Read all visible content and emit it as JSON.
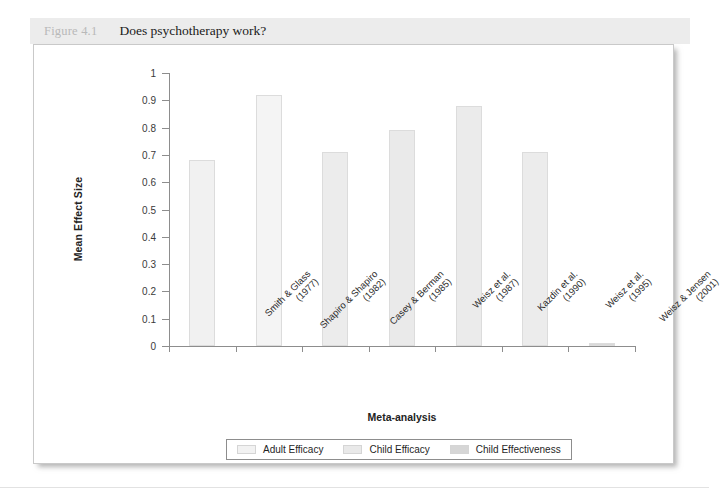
{
  "figure": {
    "number_label": "Figure 4.1",
    "title": "Does psychotherapy work?"
  },
  "chart_data": {
    "type": "bar",
    "title": "Does psychotherapy work?",
    "xlabel": "Meta-analysis",
    "ylabel": "Mean Effect Size",
    "ylim": [
      0,
      1
    ],
    "ytick_step": 0.1,
    "grid": false,
    "legend_position": "bottom",
    "categories": [
      "Smith & Glass (1977)",
      "Shapiro & Shapiro (1982)",
      "Casey & Berman (1985)",
      "Weisz et al. (1987)",
      "Kazdin et al. (1990)",
      "Weisz et al. (1995)",
      "Weisz & Jensen (2001)"
    ],
    "category_lines": [
      [
        "Smith & Glass",
        "(1977)"
      ],
      [
        "Shapiro & Shapiro",
        "(1982)"
      ],
      [
        "Casey & Berman",
        "(1985)"
      ],
      [
        "Weisz et al.",
        "(1987)"
      ],
      [
        "Kazdin et al.",
        "(1990)"
      ],
      [
        "Weisz et al.",
        "(1995)"
      ],
      [
        "Weisz & Jensen",
        "(2001)"
      ]
    ],
    "values": [
      0.68,
      0.92,
      0.71,
      0.79,
      0.88,
      0.71,
      0.01
    ],
    "bar_series": [
      "Adult Efficacy",
      "Adult Efficacy",
      "Child Efficacy",
      "Child Efficacy",
      "Child Efficacy",
      "Child Efficacy",
      "Child Effectiveness"
    ],
    "bar_colors": [
      "#f1f1f1",
      "#f4f4f4",
      "#ececec",
      "#eaeaea",
      "#ebebeb",
      "#ececec",
      "#d9d9d9"
    ],
    "ytick_labels": [
      "1",
      "0.9",
      "0.8",
      "0.7",
      "0.6",
      "0.5",
      "0.4",
      "0.3",
      "0.2",
      "0.1",
      "0"
    ],
    "ytick_values": [
      1,
      0.9,
      0.8,
      0.7,
      0.6,
      0.5,
      0.4,
      0.3,
      0.2,
      0.1,
      0
    ],
    "legend": [
      {
        "label": "Adult Efficacy",
        "color": "#f2f2f2"
      },
      {
        "label": "Child Efficacy",
        "color": "#e9e9e9"
      },
      {
        "label": "Child Effectiveness",
        "color": "#d6d6d6"
      }
    ]
  }
}
